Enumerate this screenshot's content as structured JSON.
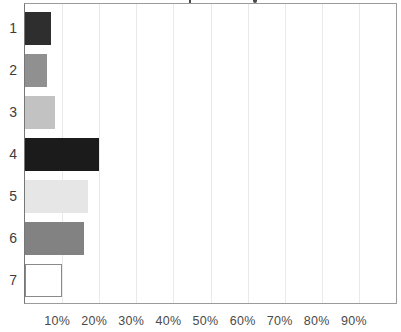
{
  "chart_data": {
    "type": "bar",
    "orientation": "horizontal",
    "title": "",
    "clipped_title_visible": true,
    "categories": [
      "1",
      "2",
      "3",
      "4",
      "5",
      "6",
      "7"
    ],
    "values": [
      7,
      6,
      8,
      20,
      17,
      16,
      10
    ],
    "value_unit": "percent",
    "bar_styles": [
      {
        "fill": "#2e2e2e",
        "border": "#2e2e2e"
      },
      {
        "fill": "#909090",
        "border": "#909090"
      },
      {
        "fill": "#c2c2c2",
        "border": "#c2c2c2"
      },
      {
        "fill": "#1b1b1b",
        "border": "#1b1b1b"
      },
      {
        "fill": "#e6e6e6",
        "border": "#e6e6e6"
      },
      {
        "fill": "#828282",
        "border": "#828282"
      },
      {
        "fill": "#ffffff",
        "border": "#8a8a8a"
      }
    ],
    "xlabel": "",
    "ylabel": "",
    "xlim": [
      0,
      100
    ],
    "x_tick_labels": [
      "10%",
      "20%",
      "30%",
      "40%",
      "50%",
      "60%",
      "70%",
      "80%",
      "90%"
    ],
    "x_tick_values": [
      10,
      20,
      30,
      40,
      50,
      60,
      70,
      80,
      90
    ],
    "grid": "vertical",
    "gridline_color": "#e9e9e9",
    "frame_color": "#9b9b9b",
    "legend": null
  }
}
